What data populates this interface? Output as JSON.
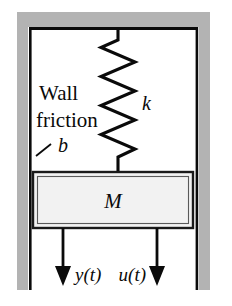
{
  "diagram": {
    "type": "mechanical-system-schematic",
    "colors": {
      "wall_fill": "#b3b3b3",
      "wall_line": "#0a0a0a",
      "mass_fill": "#f0f0f0",
      "mass_border": "#1a1a1a",
      "spring_stroke": "#0a0a0a",
      "arrow": "#0a0a0a",
      "background": "#ffffff"
    },
    "labels": {
      "wall_line1": "Wall",
      "wall_line2": "friction",
      "damping": "b",
      "spring": "k",
      "mass": "M",
      "output": "y(t)",
      "input": "u(t)"
    },
    "geometry": {
      "wall_top_y": 12,
      "wall_top_height": 15,
      "wall_left_x": 17,
      "wall_right_x": 198,
      "wall_band_width": 11,
      "wall_bottom_y": 290,
      "frame_left_x": 29,
      "frame_right_x": 197,
      "frame_top_y": 28,
      "spring_center_x": 118,
      "spring_top_y": 30,
      "spring_bottom_y": 172,
      "spring_coils": 9,
      "spring_half_width": 17,
      "mass_x": 33,
      "mass_y": 172,
      "mass_width": 160,
      "mass_height": 56,
      "arrow_left_x": 63,
      "arrow_right_x": 157,
      "arrow_top_y": 228,
      "arrow_bottom_y": 286
    }
  }
}
